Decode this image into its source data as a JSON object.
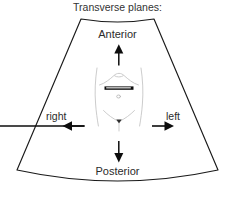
{
  "figure": {
    "title": "Transverse planes:",
    "kind": "ultrasound-sector-orientation-diagram",
    "background_color": "#ffffff",
    "outline_color": "#1a1a1a",
    "body_outline_color": "#cfcfcf",
    "marker_color": "#000000",
    "text_color": "#2b2b2b"
  },
  "labels": {
    "anterior": "Anterior",
    "posterior": "Posterior",
    "right": "right",
    "left": "left"
  },
  "arrows": {
    "up": "arrow-up-icon",
    "down": "arrow-down-icon",
    "left": "arrow-left-icon",
    "right": "arrow-right-icon"
  },
  "anatomy": {
    "torso": "human-torso-outline",
    "plane_marker": "transverse-plane-bar",
    "navel": "navel-circle"
  }
}
